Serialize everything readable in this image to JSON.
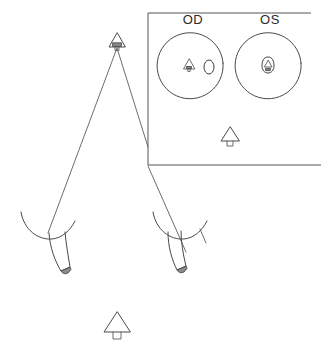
{
  "diagram": {
    "title_visible": false,
    "background_color": "#ffffff",
    "ink_color": "#4a4a4a",
    "panel": {
      "name": "eye-examination-panel",
      "left": 148,
      "top": 13,
      "right": 311,
      "bottom": 165,
      "borders_drawn": [
        "top",
        "left",
        "bottom"
      ]
    },
    "eye_labels": [
      {
        "id": "od",
        "text": "OD",
        "x": 193,
        "y": 24
      },
      {
        "id": "os",
        "text": "OS",
        "x": 270,
        "y": 24
      }
    ],
    "fundus_circles": [
      {
        "id": "od-circle",
        "label": "OD",
        "cx": 190,
        "cy": 63,
        "r": 33,
        "contents": [
          {
            "kind": "tree-marker",
            "cx": 189,
            "cy": 65,
            "scale": 0.55
          },
          {
            "kind": "oval-lesion",
            "cx": 209,
            "cy": 67,
            "rx": 5,
            "ry": 7
          }
        ]
      },
      {
        "id": "os-circle",
        "label": "OS",
        "cx": 268,
        "cy": 63,
        "r": 33,
        "contents": [
          {
            "kind": "dome-marker",
            "cx": 268,
            "cy": 65,
            "rx": 6,
            "ry": 8
          }
        ]
      }
    ],
    "tree_markers": [
      {
        "id": "apex-tree",
        "cx": 117,
        "cy": 43,
        "scale": 0.62,
        "shaded": true
      },
      {
        "id": "panel-tree",
        "cx": 230,
        "cy": 137,
        "scale": 0.72,
        "shaded": false
      },
      {
        "id": "bottom-tree",
        "cx": 117,
        "cy": 326,
        "scale": 1.0,
        "shaded": false
      }
    ],
    "sight_lines": [
      {
        "id": "left-sight-line",
        "x1": 117,
        "y1": 48,
        "x2": 48,
        "y2": 233
      },
      {
        "id": "right-sight-line",
        "x1": 117,
        "y1": 48,
        "x2": 148,
        "y2": 147
      },
      {
        "id": "panel-sight-line",
        "x1": 148,
        "y1": 166,
        "x2": 186,
        "y2": 252
      }
    ],
    "arc_pendants": [
      {
        "id": "left-arc-pendant",
        "arc": {
          "cx": 48,
          "cy": 196,
          "r": 36,
          "start_deg": 130,
          "end_deg": 50
        },
        "pendant": {
          "top_x": 52,
          "top_y": 231,
          "bottom_x": 66,
          "bottom_y": 272
        }
      },
      {
        "id": "right-arc-pendant",
        "arc": {
          "cx": 180,
          "cy": 196,
          "r": 36,
          "start_deg": 130,
          "end_deg": 48
        },
        "pendant": {
          "top_x": 170,
          "top_y": 231,
          "bottom_x": 182,
          "bottom_y": 271
        }
      }
    ],
    "tick_mark": {
      "id": "right-arc-tick",
      "x1": 200,
      "y1": 229,
      "x2": 206,
      "y2": 243
    }
  }
}
